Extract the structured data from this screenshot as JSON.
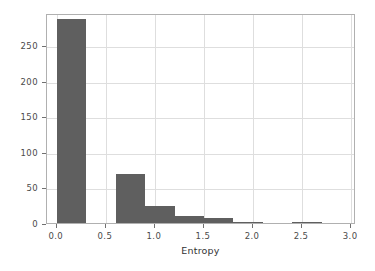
{
  "chart_data": {
    "type": "bar",
    "title": "",
    "subtitle": "",
    "xlabel": "Entropy",
    "ylabel": "",
    "xlim": [
      -0.1,
      3.05
    ],
    "ylim": [
      0,
      295
    ],
    "grid": true,
    "legend": null,
    "bar_color": "#5f5f5f",
    "grid_color": "#dedede",
    "frame_color": "#b0b0b0",
    "bin_width": 0.3,
    "xticks": [
      0.0,
      0.5,
      1.0,
      1.5,
      2.0,
      2.5,
      3.0
    ],
    "xticklabels": [
      "0.0",
      "0.5",
      "1.0",
      "1.5",
      "2.0",
      "2.5",
      "3.0"
    ],
    "yticks": [
      0,
      50,
      100,
      150,
      200,
      250
    ],
    "yticklabels": [
      "0",
      "50",
      "100",
      "150",
      "200",
      "250"
    ],
    "bins": [
      {
        "x0": 0.0,
        "x1": 0.3,
        "value": 286
      },
      {
        "x0": 0.3,
        "x1": 0.6,
        "value": 0
      },
      {
        "x0": 0.6,
        "x1": 0.9,
        "value": 69
      },
      {
        "x0": 0.9,
        "x1": 1.2,
        "value": 24
      },
      {
        "x0": 1.2,
        "x1": 1.5,
        "value": 10
      },
      {
        "x0": 1.5,
        "x1": 1.8,
        "value": 7
      },
      {
        "x0": 1.8,
        "x1": 2.1,
        "value": 1
      },
      {
        "x0": 2.1,
        "x1": 2.4,
        "value": 0
      },
      {
        "x0": 2.4,
        "x1": 2.7,
        "value": 1
      },
      {
        "x0": 2.7,
        "x1": 3.0,
        "value": 0
      }
    ]
  }
}
